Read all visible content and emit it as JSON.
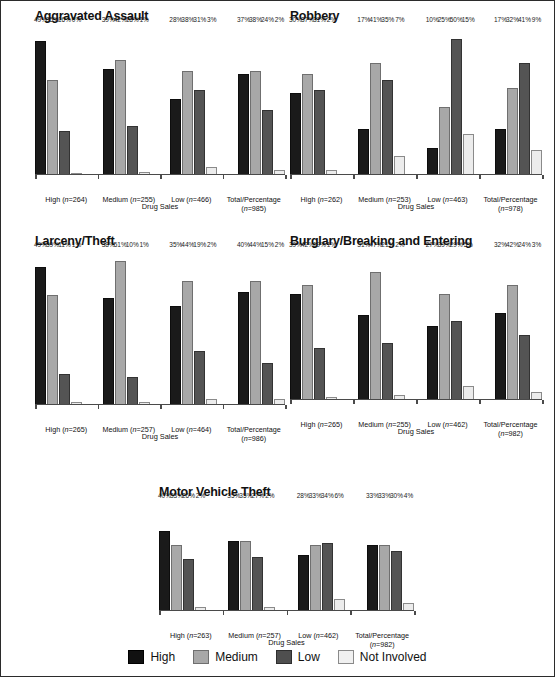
{
  "legend": {
    "items": [
      {
        "key": "high",
        "label": "High",
        "color": "#111111"
      },
      {
        "key": "medium",
        "label": "Medium",
        "color": "#a8a8a8"
      },
      {
        "key": "low",
        "label": "Low",
        "color": "#4f4f4f"
      },
      {
        "key": "notinv",
        "label": "Not Involved",
        "color": "#f0f0f0"
      }
    ]
  },
  "chart_data": [
    {
      "type": "bar",
      "title": "Aggravated Assault",
      "xlabel": "Drug Sales",
      "ylabel": "",
      "ylim": [
        0,
        55
      ],
      "grid": false,
      "legend_position": "bottom-shared",
      "categories": [
        "High (n=264)",
        "Medium (n=255)",
        "Low (n=466)",
        "Total/Percentage (n=985)"
      ],
      "category_lines": [
        [
          "High (",
          "n",
          "=264)"
        ],
        [
          "Medium (",
          "n",
          "=255)"
        ],
        [
          "Low (",
          "n",
          "=466)"
        ],
        [
          "Total/Percentage",
          "(",
          "n",
          "=985)"
        ]
      ],
      "series": [
        {
          "name": "High",
          "values": [
            49,
            39,
            28,
            37
          ],
          "labels": [
            "49%",
            "39%",
            "28%",
            "37%"
          ]
        },
        {
          "name": "Medium",
          "values": [
            35,
            42,
            38,
            38
          ],
          "labels": [
            "35%",
            "42%",
            "38%",
            "38%"
          ]
        },
        {
          "name": "Low",
          "values": [
            16,
            18,
            31,
            24
          ],
          "labels": [
            "16%",
            "18%",
            "31%",
            "24%"
          ]
        },
        {
          "name": "Not Involved",
          "values": [
            0,
            1,
            3,
            2
          ],
          "labels": [
            "0%",
            "1%",
            "3%",
            "2%"
          ]
        }
      ]
    },
    {
      "type": "bar",
      "title": "Robbery",
      "xlabel": "Drug Sales",
      "ylabel": "",
      "ylim": [
        0,
        55
      ],
      "grid": false,
      "legend_position": "bottom-shared",
      "categories": [
        "High (n=262)",
        "Medium (n=253)",
        "Low (n=463)",
        "Total/Percentage (n=978)"
      ],
      "series": [
        {
          "name": "High",
          "values": [
            30,
            17,
            10,
            17
          ],
          "labels": [
            "30%",
            "17%",
            "10%",
            "17%"
          ]
        },
        {
          "name": "Medium",
          "values": [
            37,
            41,
            25,
            32
          ],
          "labels": [
            "37%",
            "41%",
            "25%",
            "32%"
          ]
        },
        {
          "name": "Low",
          "values": [
            31,
            35,
            50,
            41
          ],
          "labels": [
            "31%",
            "35%",
            "50%",
            "41%"
          ]
        },
        {
          "name": "Not Involved",
          "values": [
            2,
            7,
            15,
            9
          ],
          "labels": [
            "2%",
            "7%",
            "15%",
            "9%"
          ]
        }
      ]
    },
    {
      "type": "bar",
      "title": "Larceny/Theft",
      "xlabel": "Drug Sales",
      "ylabel": "",
      "ylim": [
        0,
        55
      ],
      "grid": false,
      "legend_position": "bottom-shared",
      "categories": [
        "High (n=265)",
        "Medium (n=257)",
        "Low (n=464)",
        "Total/Percentage (n=986)"
      ],
      "series": [
        {
          "name": "High",
          "values": [
            49,
            38,
            35,
            40
          ],
          "labels": [
            "49%",
            "38%",
            "35%",
            "40%"
          ]
        },
        {
          "name": "Medium",
          "values": [
            39,
            51,
            44,
            44
          ],
          "labels": [
            "39%",
            "51%",
            "44%",
            "44%"
          ]
        },
        {
          "name": "Low",
          "values": [
            11,
            10,
            19,
            15
          ],
          "labels": [
            "11%",
            "10%",
            "19%",
            "15%"
          ]
        },
        {
          "name": "Not Involved",
          "values": [
            1,
            1,
            2,
            2
          ],
          "labels": [
            "1%",
            "1%",
            "2%",
            "2%"
          ]
        }
      ]
    },
    {
      "type": "bar",
      "title": "Burglary/Breaking and Entering",
      "xlabel": "Drug Sales",
      "ylabel": "",
      "ylim": [
        0,
        55
      ],
      "grid": false,
      "legend_position": "bottom-shared",
      "categories": [
        "High (n=265)",
        "Medium (n=255)",
        "Low (n=462)",
        "Total/Percentage (n=982)"
      ],
      "series": [
        {
          "name": "High",
          "values": [
            39,
            31,
            27,
            32
          ],
          "labels": [
            "39%",
            "31%",
            "27%",
            "32%"
          ]
        },
        {
          "name": "Medium",
          "values": [
            42,
            47,
            39,
            42
          ],
          "labels": [
            "42%",
            "47%",
            "39%",
            "42%"
          ]
        },
        {
          "name": "Low",
          "values": [
            19,
            21,
            29,
            24
          ],
          "labels": [
            "19%",
            "21%",
            "29%",
            "24%"
          ]
        },
        {
          "name": "Not Involved",
          "values": [
            1,
            2,
            5,
            3
          ],
          "labels": [
            "1%",
            "2%",
            "5%",
            "3%"
          ]
        }
      ]
    },
    {
      "type": "bar",
      "title": "Motor Vehicle Theft",
      "xlabel": "Drug Sales",
      "ylabel": "",
      "ylim": [
        0,
        55
      ],
      "grid": false,
      "legend_position": "bottom-shared",
      "categories": [
        "High (n=263)",
        "Medium (n=257)",
        "Low (n=462)",
        "Total/Percentage (n=982)"
      ],
      "series": [
        {
          "name": "High",
          "values": [
            40,
            35,
            28,
            33
          ],
          "labels": [
            "40%",
            "35%",
            "28%",
            "33%"
          ]
        },
        {
          "name": "Medium",
          "values": [
            33,
            35,
            33,
            33
          ],
          "labels": [
            "33%",
            "35%",
            "33%",
            "33%"
          ]
        },
        {
          "name": "Low",
          "values": [
            26,
            27,
            34,
            30
          ],
          "labels": [
            "26%",
            "27%",
            "34%",
            "30%"
          ]
        },
        {
          "name": "Not Involved",
          "values": [
            2,
            2,
            6,
            4
          ],
          "labels": [
            "2%",
            "2%",
            "6%",
            "4%"
          ]
        }
      ]
    }
  ]
}
